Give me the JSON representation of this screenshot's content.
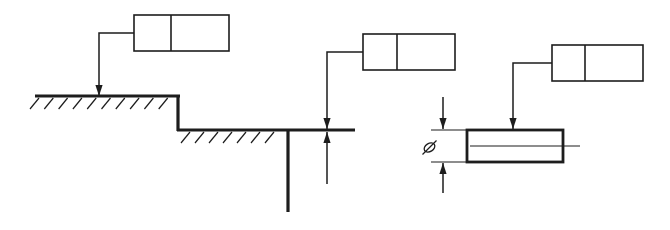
{
  "canvas": {
    "width": 670,
    "height": 230,
    "background": "#ffffff",
    "ink": "#1d1d1d"
  },
  "styles": {
    "frame_stroke": 1.6,
    "leader_stroke": 1.5,
    "outline_stroke": 3.2,
    "pin_stroke": 2.8,
    "thin_stroke": 1.2,
    "hatch_stroke": 1.2,
    "symbol_stroke": 1.3,
    "arrow_len": 11,
    "arrow_half_w": 3.6
  },
  "feature_control_frames": [
    {
      "name": "feature-control-frame-1",
      "x": 134,
      "y": 15,
      "width": 95,
      "height": 36,
      "divider_offset": 37
    },
    {
      "name": "feature-control-frame-2",
      "x": 363,
      "y": 34,
      "width": 92,
      "height": 36,
      "divider_offset": 34
    },
    {
      "name": "feature-control-frame-3",
      "x": 552,
      "y": 45,
      "width": 91,
      "height": 36,
      "divider_offset": 33
    }
  ],
  "leaders": [
    {
      "name": "leader-to-upper-surface",
      "points": [
        [
          134,
          33
        ],
        [
          99,
          33
        ],
        [
          99,
          96
        ]
      ],
      "arrow": "down"
    },
    {
      "name": "leader-to-extension-line",
      "points": [
        [
          363,
          52
        ],
        [
          327,
          52
        ],
        [
          327,
          129
        ]
      ],
      "arrow": "down"
    },
    {
      "name": "leader-to-pin-surface",
      "points": [
        [
          552,
          63
        ],
        [
          513,
          63
        ],
        [
          513,
          129
        ]
      ],
      "arrow": "down"
    }
  ],
  "part_outline": {
    "thick_segments": [
      [
        35,
        96,
        180,
        96
      ],
      [
        178,
        95,
        178,
        131
      ],
      [
        177,
        130,
        355,
        130
      ],
      [
        288,
        130,
        288,
        212
      ]
    ]
  },
  "hatching": [
    {
      "name": "hatch-upper-surface",
      "y_top": 98,
      "x_start": 39,
      "count": 10,
      "spacing": 14.3,
      "dx": -9,
      "dy": 11
    },
    {
      "name": "hatch-lower-surface",
      "y_top": 132,
      "x_start": 190,
      "count": 7,
      "spacing": 14,
      "dx": -9,
      "dy": 11
    }
  ],
  "dimension_arrows": [
    {
      "name": "step-dimension-arrow-up",
      "tip": [
        327,
        132
      ],
      "dir": "up",
      "tail": [
        327,
        184
      ]
    },
    {
      "name": "diameter-dimension-arrow-down",
      "tip": [
        443,
        129
      ],
      "dir": "down",
      "tail": [
        443,
        97
      ]
    },
    {
      "name": "diameter-dimension-arrow-up",
      "tip": [
        443,
        163
      ],
      "dir": "up",
      "tail": [
        443,
        193
      ]
    }
  ],
  "extension_lines": [
    [
      431,
      130,
      468,
      130
    ],
    [
      431,
      162,
      468,
      162
    ]
  ],
  "pin": {
    "x": 467,
    "y": 130,
    "width": 96,
    "height": 32,
    "centerline": [
      470,
      146,
      580,
      146
    ]
  },
  "diameter_symbol": {
    "name": "diameter-symbol",
    "glyph": "⌀",
    "cx": 429.5,
    "cy": 147.5,
    "rx": 5.8,
    "ry": 4.0,
    "rotation": -33,
    "slash": [
      422.5,
      154.5,
      436.5,
      140.5
    ]
  }
}
